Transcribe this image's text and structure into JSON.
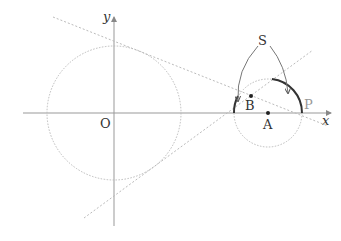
{
  "diagram": {
    "type": "geometry",
    "axes": {
      "x_label": "x",
      "y_label": "y",
      "origin_label": "O"
    },
    "circles": [
      {
        "name": "circle-O",
        "center_label": "O",
        "style": "dotted"
      },
      {
        "name": "circle-A",
        "center_label": "A",
        "style": "dotted"
      }
    ],
    "points": {
      "A": "A",
      "B": "B",
      "P": "P"
    },
    "region_label": "S",
    "tangent_lines": 2,
    "colors": {
      "axis": "#999999",
      "dotted": "#bbbbbb",
      "arc": "#333333",
      "curve": "#777777",
      "text": "#333333",
      "point_p": "#999999"
    }
  }
}
